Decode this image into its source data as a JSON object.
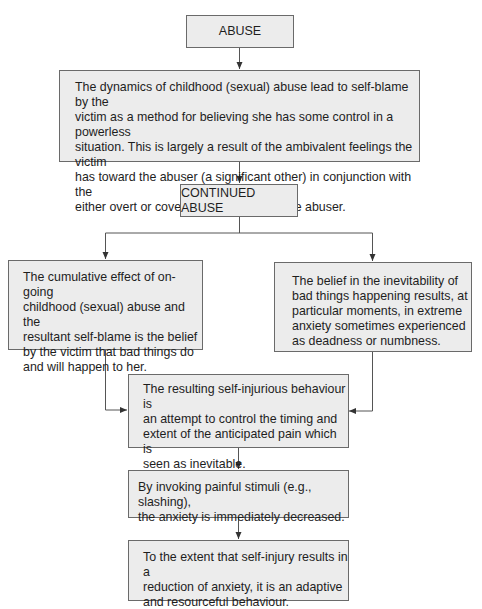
{
  "diagram": {
    "type": "flowchart",
    "title_partial": "",
    "nodes": [
      {
        "id": "abuse",
        "label": "ABUSE"
      },
      {
        "id": "dynamics",
        "label": "The dynamics of childhood (sexual) abuse lead to self-blame by the victim as a method for believing she has some control in a powerless situation. This is largely a result of the ambivalent feelings the victim has toward the abuser (a significant other) in conjunction with the either overt or covert threats made by the abuser.",
        "lines": [
          "The dynamics of childhood (sexual) abuse lead to self-blame by the",
          "victim as a method for believing she has some control in a powerless",
          "situation. This is largely a result of the ambivalent feelings the victim",
          "has toward the abuser (a significant other) in conjunction with the",
          "either overt or covert threats made by the abuser."
        ]
      },
      {
        "id": "continued",
        "label": "CONTINUED ABUSE"
      },
      {
        "id": "cumulative",
        "label": "The cumulative effect of on-going childhood (sexual) abuse and the resultant self-blame is the belief by the victim that bad things do and will happen to her.",
        "lines": [
          "The cumulative effect of on-going",
          "childhood (sexual) abuse and the",
          "resultant self-blame is the belief",
          "by the victim that bad things do",
          "and will happen to her."
        ]
      },
      {
        "id": "inevitability",
        "label": "The belief in the inevitability of bad things happening results, at particular moments, in extreme anxiety sometimes experienced as deadness or numbness.",
        "lines": [
          "The belief in the inevitability of",
          "bad things happening results, at",
          "particular moments, in extreme",
          "anxiety sometimes experienced",
          "as deadness or numbness."
        ]
      },
      {
        "id": "resulting",
        "label": "The resulting self-injurious behaviour is an attempt to control the timing and extent of the anticipated pain which is seen as inevitable.",
        "lines": [
          "The resulting self-injurious behaviour is",
          "an attempt to control the timing and",
          "extent of the anticipated pain which is",
          "seen as inevitable."
        ]
      },
      {
        "id": "invoking",
        "label": "By invoking painful stimuli (e.g., slashing), the anxiety is immediately decreased.",
        "lines": [
          "By invoking painful stimuli (e.g., slashing),",
          "the anxiety is immediately decreased."
        ]
      },
      {
        "id": "extent",
        "label": "To the extent that self-injury results in a reduction of anxiety, it is an adaptive and resourceful behaviour.",
        "lines": [
          "To the extent that self-injury results in a",
          "reduction of anxiety, it is an adaptive",
          "and resourceful behaviour."
        ]
      }
    ],
    "edges": [
      {
        "from": "abuse",
        "to": "dynamics"
      },
      {
        "from": "dynamics",
        "to": "continued"
      },
      {
        "from": "continued",
        "to": "cumulative"
      },
      {
        "from": "continued",
        "to": "inevitability"
      },
      {
        "from": "cumulative",
        "to": "resulting"
      },
      {
        "from": "inevitability",
        "to": "resulting"
      },
      {
        "from": "resulting",
        "to": "invoking"
      },
      {
        "from": "invoking",
        "to": "extent"
      }
    ],
    "colors": {
      "box_fill": "#ececec",
      "box_border": "#6a6a6a",
      "line": "#333333",
      "text": "#1e1e1e"
    }
  }
}
